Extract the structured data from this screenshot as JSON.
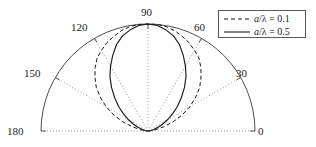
{
  "chart_data": {
    "type": "line",
    "subtype": "polar-radiation-pattern",
    "title": "",
    "xlabel": "",
    "ylabel": "",
    "grid": true,
    "legend_position": "top-right",
    "polar": {
      "origin_x": 148,
      "origin_y": 131,
      "radius": 107,
      "angle_start_deg": 0,
      "angle_end_deg": 180,
      "tick_labels": [
        "0",
        "30",
        "60",
        "90",
        "120",
        "150",
        "180"
      ],
      "tick_angles_deg": [
        0,
        30,
        60,
        90,
        120,
        150,
        180
      ],
      "radial_range": [
        0,
        1
      ]
    },
    "series": [
      {
        "name": "a/lambda = 0.1",
        "label": "a/λ = 0.1",
        "style": "dashed",
        "color": "#1a1a1a",
        "angles_deg": [
          0,
          5,
          10,
          15,
          20,
          25,
          30,
          35,
          40,
          45,
          50,
          55,
          60,
          65,
          70,
          75,
          80,
          85,
          90,
          95,
          100,
          105,
          110,
          115,
          120,
          125,
          130,
          135,
          140,
          145,
          150,
          155,
          160,
          165,
          170,
          175,
          180
        ],
        "values": [
          0.0,
          0.02,
          0.07,
          0.15,
          0.25,
          0.35,
          0.45,
          0.54,
          0.63,
          0.7,
          0.77,
          0.83,
          0.87,
          0.91,
          0.94,
          0.97,
          0.99,
          1.0,
          1.0,
          1.0,
          0.99,
          0.97,
          0.94,
          0.91,
          0.87,
          0.83,
          0.77,
          0.7,
          0.63,
          0.54,
          0.45,
          0.35,
          0.25,
          0.15,
          0.07,
          0.02,
          0.0
        ]
      },
      {
        "name": "a/lambda = 0.5",
        "label": "a/λ = 0.5",
        "style": "solid",
        "color": "#1a1a1a",
        "angles_deg": [
          0,
          5,
          10,
          15,
          20,
          25,
          30,
          35,
          40,
          45,
          50,
          55,
          60,
          65,
          70,
          75,
          80,
          85,
          90,
          95,
          100,
          105,
          110,
          115,
          120,
          125,
          130,
          135,
          140,
          145,
          150,
          155,
          160,
          165,
          170,
          175,
          180
        ],
        "values": [
          0.0,
          0.01,
          0.03,
          0.06,
          0.1,
          0.15,
          0.21,
          0.28,
          0.36,
          0.44,
          0.53,
          0.62,
          0.7,
          0.78,
          0.86,
          0.92,
          0.96,
          0.99,
          1.0,
          0.99,
          0.96,
          0.92,
          0.86,
          0.78,
          0.7,
          0.62,
          0.53,
          0.44,
          0.36,
          0.28,
          0.21,
          0.15,
          0.1,
          0.06,
          0.03,
          0.01,
          0.0
        ]
      }
    ]
  },
  "axis": {
    "labels": [
      {
        "text": "0",
        "angle_deg": 0
      },
      {
        "text": "30",
        "angle_deg": 30
      },
      {
        "text": "60",
        "angle_deg": 60
      },
      {
        "text": "90",
        "angle_deg": 90
      },
      {
        "text": "120",
        "angle_deg": 120
      },
      {
        "text": "150",
        "angle_deg": 150
      },
      {
        "text": "180",
        "angle_deg": 180
      }
    ]
  },
  "legend": {
    "entries": [
      {
        "label": "a/λ = 0.1",
        "italic_var": "a",
        "rest": "/λ = 0.1",
        "style": "dashed"
      },
      {
        "label": "a/λ = 0.5",
        "italic_var": "a",
        "rest": "/λ = 0.5",
        "style": "solid"
      }
    ]
  },
  "colors": {
    "curve": "#1a1a1a",
    "arc": "#4d4d4d",
    "grid_dotted": "#9a9a9a",
    "legend_border": "#5a5a5a",
    "background": "#ffffff"
  }
}
